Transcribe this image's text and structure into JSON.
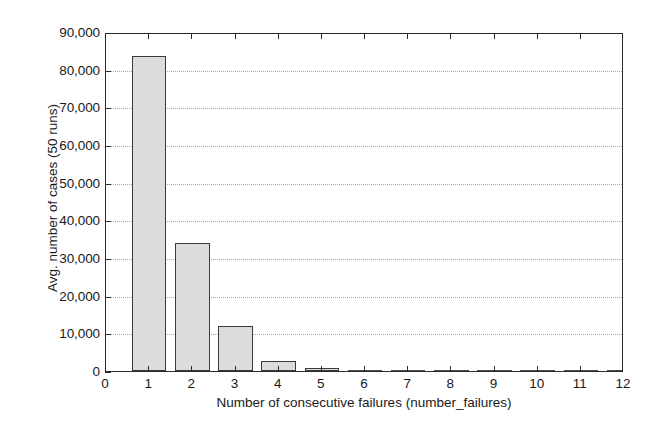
{
  "chart_data": {
    "type": "bar",
    "title": "",
    "xlabel": "Number of consecutive failures (number_failures)",
    "ylabel": "Avg. number of cases (50 runs)",
    "categories": [
      "1",
      "2",
      "3",
      "4",
      "5",
      "6",
      "7",
      "8",
      "9",
      "10",
      "11",
      "12"
    ],
    "values": [
      83700,
      34000,
      12000,
      2600,
      700,
      150,
      40,
      10,
      0,
      0,
      0,
      0
    ],
    "xlim": [
      0,
      12
    ],
    "ylim": [
      0,
      90000
    ],
    "xticks": [
      "0",
      "1",
      "2",
      "3",
      "4",
      "5",
      "6",
      "7",
      "8",
      "9",
      "10",
      "11",
      "12"
    ],
    "yticks": [
      "0",
      "10,000",
      "20,000",
      "30,000",
      "40,000",
      "50,000",
      "60,000",
      "70,000",
      "80,000",
      "90,000"
    ],
    "ytick_values": [
      0,
      10000,
      20000,
      30000,
      40000,
      50000,
      60000,
      70000,
      80000,
      90000
    ],
    "grid": "horizontal-dotted",
    "legend": "none",
    "bar_fill_color": "#dcdcdc",
    "bar_edge_color": "#3a3a3a",
    "axis_color": "#2b2b2b",
    "grid_color": "#9a9a9a",
    "background_color": "#ffffff"
  }
}
